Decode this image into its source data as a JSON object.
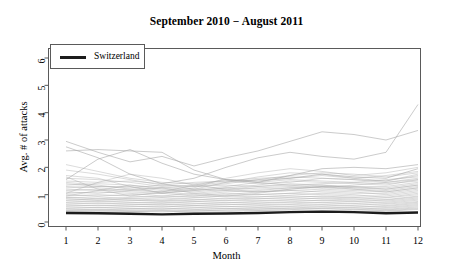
{
  "chart_data": {
    "type": "line",
    "title": "September 2010 − August 2011",
    "xlabel": "Month",
    "ylabel": "Avg. # of attacks",
    "xlim": [
      1,
      12
    ],
    "ylim": [
      0,
      6
    ],
    "grid": false,
    "legend_position": "top-left",
    "x": [
      1,
      2,
      3,
      4,
      5,
      6,
      7,
      8,
      9,
      10,
      11,
      12
    ],
    "xticks": [
      "1",
      "2",
      "3",
      "4",
      "5",
      "6",
      "7",
      "8",
      "9",
      "10",
      "11",
      "12"
    ],
    "yticks": [
      "0",
      "1",
      "2",
      "3",
      "4",
      "5",
      "6"
    ],
    "legend": [
      {
        "name": "Switzerland",
        "color": "#1c1c1c",
        "width": 2.6
      }
    ],
    "highlight_series": {
      "name": "Switzerland",
      "color": "#1c1c1c",
      "values": [
        0.33,
        0.32,
        0.3,
        0.28,
        0.3,
        0.31,
        0.33,
        0.36,
        0.38,
        0.36,
        0.32,
        0.35
      ]
    },
    "background_series_color": "#a8a8a8",
    "background_series": [
      {
        "name": "line-01",
        "values": [
          2.95,
          2.55,
          2.2,
          2.4,
          2.05,
          2.35,
          2.6,
          2.95,
          3.3,
          3.2,
          3.0,
          3.35
        ]
      },
      {
        "name": "line-02",
        "values": [
          2.75,
          2.35,
          1.75,
          1.4,
          1.6,
          2.0,
          2.35,
          2.55,
          2.4,
          2.3,
          2.55,
          4.3
        ]
      },
      {
        "name": "line-03",
        "values": [
          2.6,
          2.65,
          2.6,
          2.55,
          1.9,
          1.55,
          1.45,
          1.7,
          1.95,
          2.0,
          1.95,
          2.1
        ]
      },
      {
        "name": "line-04",
        "values": [
          1.55,
          2.3,
          2.65,
          2.15,
          1.75,
          1.55,
          1.5,
          1.6,
          1.75,
          1.65,
          1.6,
          1.95
        ]
      },
      {
        "name": "line-05",
        "values": [
          1.45,
          1.35,
          1.2,
          1.1,
          1.25,
          1.6,
          1.8,
          1.95,
          1.85,
          1.7,
          1.8,
          2.0
        ]
      },
      {
        "name": "line-06",
        "values": [
          1.6,
          1.55,
          1.45,
          1.3,
          1.35,
          1.45,
          1.55,
          1.6,
          1.7,
          1.6,
          1.5,
          1.75
        ]
      },
      {
        "name": "line-07",
        "values": [
          1.5,
          1.45,
          1.5,
          1.4,
          1.2,
          1.3,
          1.45,
          1.55,
          1.5,
          1.45,
          1.55,
          1.65
        ]
      },
      {
        "name": "line-08",
        "values": [
          1.4,
          1.3,
          1.25,
          1.35,
          1.45,
          1.5,
          1.4,
          1.45,
          1.6,
          1.55,
          1.45,
          1.6
        ]
      },
      {
        "name": "line-09",
        "values": [
          1.35,
          1.4,
          1.35,
          1.2,
          1.15,
          1.25,
          1.35,
          1.5,
          1.45,
          1.4,
          1.35,
          1.55
        ]
      },
      {
        "name": "line-10",
        "values": [
          1.3,
          1.25,
          1.15,
          1.25,
          1.3,
          1.35,
          1.3,
          1.35,
          1.4,
          1.45,
          1.4,
          1.5
        ]
      },
      {
        "name": "line-11",
        "values": [
          1.25,
          1.3,
          1.3,
          1.15,
          1.1,
          1.2,
          1.3,
          1.4,
          1.35,
          1.3,
          1.3,
          1.45
        ]
      },
      {
        "name": "line-12",
        "values": [
          1.2,
          1.15,
          1.2,
          1.25,
          1.2,
          1.15,
          1.25,
          1.3,
          1.35,
          1.25,
          1.25,
          1.4
        ]
      },
      {
        "name": "line-13",
        "values": [
          1.15,
          1.2,
          1.1,
          1.05,
          1.15,
          1.25,
          1.2,
          1.25,
          1.3,
          1.3,
          1.2,
          1.35
        ]
      },
      {
        "name": "line-14",
        "values": [
          1.1,
          1.05,
          1.15,
          1.1,
          1.0,
          1.1,
          1.15,
          1.25,
          1.25,
          1.2,
          1.15,
          1.3
        ]
      },
      {
        "name": "line-15",
        "values": [
          1.05,
          1.1,
          1.05,
          0.95,
          1.05,
          1.15,
          1.1,
          1.15,
          1.2,
          1.15,
          1.1,
          1.25
        ]
      },
      {
        "name": "line-16",
        "values": [
          1.0,
          0.95,
          1.0,
          1.05,
          0.95,
          1.0,
          1.1,
          1.15,
          1.1,
          1.05,
          1.05,
          1.2
        ]
      },
      {
        "name": "line-17",
        "values": [
          0.95,
          1.0,
          0.95,
          0.9,
          0.95,
          1.05,
          1.0,
          1.05,
          1.15,
          1.1,
          1.0,
          1.15
        ]
      },
      {
        "name": "line-18",
        "values": [
          0.9,
          0.85,
          0.9,
          0.95,
          0.9,
          0.95,
          1.0,
          1.05,
          1.0,
          0.95,
          0.95,
          1.1
        ]
      },
      {
        "name": "line-19",
        "values": [
          0.88,
          0.92,
          0.85,
          0.8,
          0.88,
          0.95,
          0.92,
          0.98,
          1.05,
          1.0,
          0.9,
          1.05
        ]
      },
      {
        "name": "line-20",
        "values": [
          0.85,
          0.8,
          0.85,
          0.88,
          0.82,
          0.85,
          0.92,
          0.95,
          0.92,
          0.88,
          0.88,
          1.0
        ]
      },
      {
        "name": "line-21",
        "values": [
          0.8,
          0.85,
          0.8,
          0.75,
          0.8,
          0.88,
          0.85,
          0.9,
          0.95,
          0.9,
          0.82,
          0.95
        ]
      },
      {
        "name": "line-22",
        "values": [
          0.78,
          0.75,
          0.78,
          0.8,
          0.75,
          0.78,
          0.85,
          0.88,
          0.85,
          0.8,
          0.8,
          0.92
        ]
      },
      {
        "name": "line-23",
        "values": [
          0.72,
          0.78,
          0.72,
          0.68,
          0.74,
          0.8,
          0.78,
          0.82,
          0.88,
          0.84,
          0.76,
          0.88
        ]
      },
      {
        "name": "line-24",
        "values": [
          0.7,
          0.68,
          0.7,
          0.72,
          0.68,
          0.7,
          0.76,
          0.8,
          0.78,
          0.74,
          0.72,
          0.84
        ]
      },
      {
        "name": "line-25",
        "values": [
          0.65,
          0.7,
          0.65,
          0.62,
          0.66,
          0.72,
          0.7,
          0.74,
          0.8,
          0.76,
          0.68,
          0.8
        ]
      },
      {
        "name": "line-26",
        "values": [
          0.62,
          0.6,
          0.63,
          0.65,
          0.6,
          0.63,
          0.68,
          0.72,
          0.7,
          0.66,
          0.65,
          0.75
        ]
      },
      {
        "name": "line-27",
        "values": [
          0.58,
          0.62,
          0.58,
          0.55,
          0.6,
          0.65,
          0.63,
          0.66,
          0.72,
          0.68,
          0.6,
          0.72
        ]
      },
      {
        "name": "line-28",
        "values": [
          0.55,
          0.53,
          0.56,
          0.58,
          0.54,
          0.56,
          0.6,
          0.64,
          0.62,
          0.58,
          0.57,
          0.68
        ]
      },
      {
        "name": "line-29",
        "values": [
          0.5,
          0.54,
          0.5,
          0.48,
          0.52,
          0.57,
          0.55,
          0.58,
          0.64,
          0.6,
          0.53,
          0.64
        ]
      },
      {
        "name": "line-30",
        "values": [
          0.48,
          0.46,
          0.49,
          0.51,
          0.47,
          0.49,
          0.53,
          0.56,
          0.55,
          0.51,
          0.5,
          0.6
        ]
      },
      {
        "name": "line-31",
        "values": [
          0.44,
          0.47,
          0.44,
          0.42,
          0.45,
          0.5,
          0.48,
          0.51,
          0.56,
          0.53,
          0.46,
          0.56
        ]
      },
      {
        "name": "line-32",
        "values": [
          0.42,
          0.4,
          0.43,
          0.45,
          0.41,
          0.43,
          0.47,
          0.5,
          0.49,
          0.45,
          0.44,
          0.52
        ]
      },
      {
        "name": "line-33",
        "values": [
          0.39,
          0.42,
          0.39,
          0.37,
          0.4,
          0.44,
          0.43,
          0.45,
          0.5,
          0.47,
          0.41,
          0.49
        ]
      },
      {
        "name": "line-34",
        "values": [
          0.37,
          0.36,
          0.38,
          0.4,
          0.36,
          0.38,
          0.42,
          0.44,
          0.43,
          0.4,
          0.39,
          0.46
        ]
      },
      {
        "name": "line-35",
        "values": [
          1.7,
          1.6,
          1.3,
          1.05,
          1.2,
          1.45,
          1.65,
          1.8,
          1.75,
          1.6,
          1.7,
          1.85
        ]
      },
      {
        "name": "line-36",
        "values": [
          1.9,
          1.75,
          1.55,
          1.35,
          1.3,
          1.4,
          1.55,
          1.7,
          1.8,
          1.75,
          1.65,
          1.8
        ]
      },
      {
        "name": "line-37",
        "values": [
          2.1,
          1.85,
          1.6,
          1.45,
          1.4,
          1.5,
          1.6,
          1.65,
          1.6,
          1.55,
          1.5,
          1.7
        ]
      },
      {
        "name": "line-38",
        "values": [
          1.05,
          1.45,
          1.75,
          1.6,
          1.35,
          1.2,
          1.1,
          1.2,
          1.3,
          1.25,
          1.2,
          1.35
        ]
      },
      {
        "name": "line-39",
        "values": [
          1.65,
          1.2,
          0.95,
          1.1,
          1.35,
          1.55,
          1.45,
          1.35,
          1.25,
          1.35,
          1.45,
          1.55
        ]
      },
      {
        "name": "line-40",
        "values": [
          0.95,
          1.15,
          1.35,
          1.25,
          1.05,
          0.95,
          1.05,
          1.2,
          1.3,
          1.2,
          1.1,
          1.25
        ]
      }
    ]
  }
}
